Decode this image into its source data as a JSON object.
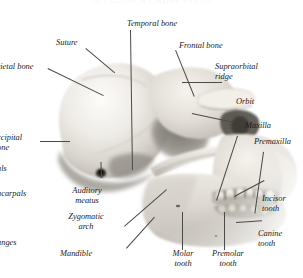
{
  "figure": {
    "title": "SKULL OF A CHIMPANZEE",
    "ink_color": "#1b1b1b",
    "leader_color": "#4a4a4a",
    "background_color": "#ffffff"
  },
  "labels": {
    "suture": "Suture",
    "temporal_bone": "Temporal bone",
    "frontal_bone": "Frontal bone",
    "supraorbital_ridge_line1": "Supraorbital",
    "supraorbital_ridge_line2": "ridge",
    "orbit": "Orbit",
    "maxilla": "Maxilla",
    "premaxilla": "Premaxilla",
    "parietal_bone": "rietal bone",
    "occipital_bone_line1": "ccipital",
    "occipital_bone_line2": "one",
    "carpals": "als",
    "metacarpals": "acarpals",
    "phalanges": "anges",
    "auditory_meatus_line1": "Auditory",
    "auditory_meatus_line2": "meatus",
    "zygomatic_arch_line1": "Zygomatic",
    "zygomatic_arch_line2": "arch",
    "mandible": "Mandible",
    "molar_tooth_line1": "Molar",
    "molar_tooth_line2": "tooth",
    "premolar_tooth_line1": "Premolar",
    "premolar_tooth_line2": "tooth",
    "canine_tooth_line1": "Canine",
    "canine_tooth_line2": "tooth",
    "incisor_tooth_line1": "Incisor",
    "incisor_tooth_line2": "tooth"
  }
}
